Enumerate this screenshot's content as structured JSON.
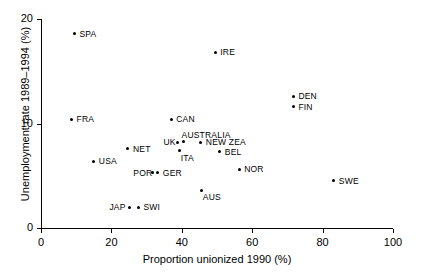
{
  "chart_data": {
    "type": "scatter",
    "title": "",
    "xlabel": "Proportion unionized 1990 (%)",
    "ylabel": "Unemployment rate 1989–1994 (%)",
    "xlim": [
      0,
      100
    ],
    "ylim": [
      0,
      20
    ],
    "xticks": [
      0,
      20,
      40,
      60,
      80,
      100
    ],
    "yticks": [
      0,
      10,
      20
    ],
    "xtick_labels": [
      "0",
      "20",
      "40",
      "60",
      "80",
      "100"
    ],
    "ytick_labels": [
      "0",
      "10",
      "20"
    ],
    "grid": false,
    "legend": false,
    "points": [
      {
        "label": "SPA",
        "x": 9.5,
        "y": 18.6,
        "label_pos": "right"
      },
      {
        "label": "FRA",
        "x": 8.7,
        "y": 10.4,
        "label_pos": "right"
      },
      {
        "label": "USA",
        "x": 15.0,
        "y": 6.4,
        "label_pos": "right"
      },
      {
        "label": "NET",
        "x": 24.7,
        "y": 7.6,
        "label_pos": "right"
      },
      {
        "label": "JAP",
        "x": 25.0,
        "y": 2.0,
        "label_pos": "left"
      },
      {
        "label": "SWI",
        "x": 27.7,
        "y": 2.0,
        "label_pos": "right"
      },
      {
        "label": "POR",
        "x": 31.8,
        "y": 5.3,
        "label_pos": "left"
      },
      {
        "label": "GER",
        "x": 33.2,
        "y": 5.3,
        "label_pos": "right"
      },
      {
        "label": "CAN",
        "x": 37.0,
        "y": 10.4,
        "label_pos": "right"
      },
      {
        "label": "UK",
        "x": 38.9,
        "y": 8.2,
        "label_pos": "left"
      },
      {
        "label": "ITA",
        "x": 39.4,
        "y": 7.4,
        "label_pos": "below-right"
      },
      {
        "label": "AUSTRALIA",
        "x": 40.5,
        "y": 8.3,
        "label_pos": "above-right"
      },
      {
        "label": "NEW ZEA",
        "x": 45.4,
        "y": 8.2,
        "label_pos": "right"
      },
      {
        "label": "AUS",
        "x": 45.7,
        "y": 3.6,
        "label_pos": "below-right"
      },
      {
        "label": "IRE",
        "x": 49.5,
        "y": 16.8,
        "label_pos": "right"
      },
      {
        "label": "BEL",
        "x": 50.8,
        "y": 7.3,
        "label_pos": "right"
      },
      {
        "label": "NOR",
        "x": 56.3,
        "y": 5.6,
        "label_pos": "right"
      },
      {
        "label": "DEN",
        "x": 71.7,
        "y": 12.6,
        "label_pos": "right"
      },
      {
        "label": "FIN",
        "x": 71.7,
        "y": 11.6,
        "label_pos": "right"
      },
      {
        "label": "SWE",
        "x": 83.2,
        "y": 4.5,
        "label_pos": "right"
      }
    ],
    "colors": {
      "marker": "#000000",
      "axis": "#000000",
      "background": "#ffffff"
    }
  }
}
